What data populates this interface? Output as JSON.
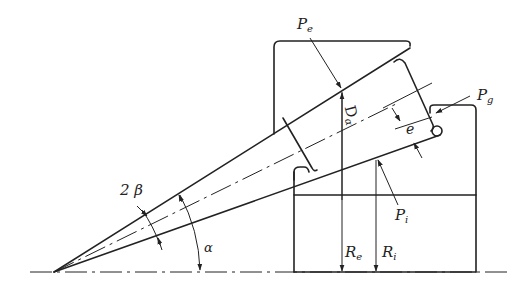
{
  "diagram": {
    "labels": {
      "pe_main": "P",
      "pe_sub": "e",
      "pg_main": "P",
      "pg_sub": "g",
      "pi_main": "P",
      "pi_sub": "i",
      "re_main": "R",
      "re_sub": "e",
      "ri_main": "R",
      "ri_sub": "i",
      "d_main": "D",
      "d_sub": "α",
      "e": "e",
      "two_beta": "2 β",
      "alpha": "α"
    },
    "colors": {
      "line": "#222222",
      "background": "#ffffff"
    }
  }
}
